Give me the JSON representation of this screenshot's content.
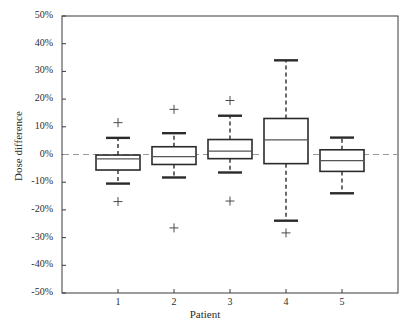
{
  "figure": {
    "top_cropped_text": "",
    "background_color": "#ffffff",
    "axis_color": "#3a3a3a",
    "box_color": "#2b2b2b",
    "zero_line_color": "#9a9a9a"
  },
  "chart_data": {
    "type": "box",
    "title": "",
    "xlabel": "Patient",
    "ylabel": "Dose difference",
    "categories": [
      "1",
      "2",
      "3",
      "4",
      "5"
    ],
    "x_tick_labels": [
      "1",
      "2",
      "3",
      "4",
      "5"
    ],
    "y_tick_labels": [
      "50%",
      "40%",
      "30%",
      "20%",
      "10%",
      "0%",
      "-10%",
      "-20%",
      "-30%",
      "-40%",
      "-50%"
    ],
    "y_tick_values": [
      50,
      40,
      30,
      20,
      10,
      0,
      -10,
      -20,
      -30,
      -40,
      -50
    ],
    "ylim": [
      -50,
      50
    ],
    "y_units": "percent",
    "grid": false,
    "legend": null,
    "reference_line": {
      "value": 0,
      "style": "dashed",
      "color": "#9a9a9a"
    },
    "boxes": [
      {
        "category": "1",
        "whisker_low": -10.5,
        "q1": -5.6,
        "median": -1.6,
        "q3": -0.2,
        "whisker_high": 6.0,
        "outliers": [
          11.5,
          -17.0
        ]
      },
      {
        "category": "2",
        "whisker_low": -8.3,
        "q1": -3.6,
        "median": -0.8,
        "q3": 2.8,
        "whisker_high": 7.7,
        "outliers": [
          16.3,
          -26.5
        ]
      },
      {
        "category": "3",
        "whisker_low": -6.5,
        "q1": -1.5,
        "median": 1.2,
        "q3": 5.4,
        "whisker_high": 14.0,
        "outliers": [
          19.5,
          -16.8
        ]
      },
      {
        "category": "4",
        "whisker_low": -23.9,
        "q1": -3.3,
        "median": 5.3,
        "q3": 13.0,
        "whisker_high": 34.0,
        "outliers": [
          -28.3
        ]
      },
      {
        "category": "5",
        "whisker_low": -14.0,
        "q1": -6.1,
        "median": -2.2,
        "q3": 1.7,
        "whisker_high": 6.1,
        "outliers": []
      }
    ]
  }
}
